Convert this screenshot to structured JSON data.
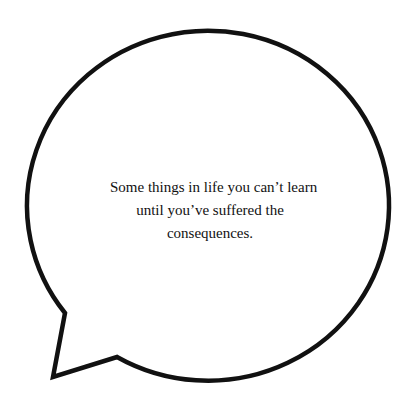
{
  "bubble": {
    "shape": "speech-bubble",
    "stroke_color": "#111111",
    "fill_color": "#ffffff",
    "tail_direction": "bottom-left"
  },
  "quote": {
    "lines": [
      "Some things in life you can’t learn",
      "until you’ve suffered the",
      "consequences."
    ]
  }
}
